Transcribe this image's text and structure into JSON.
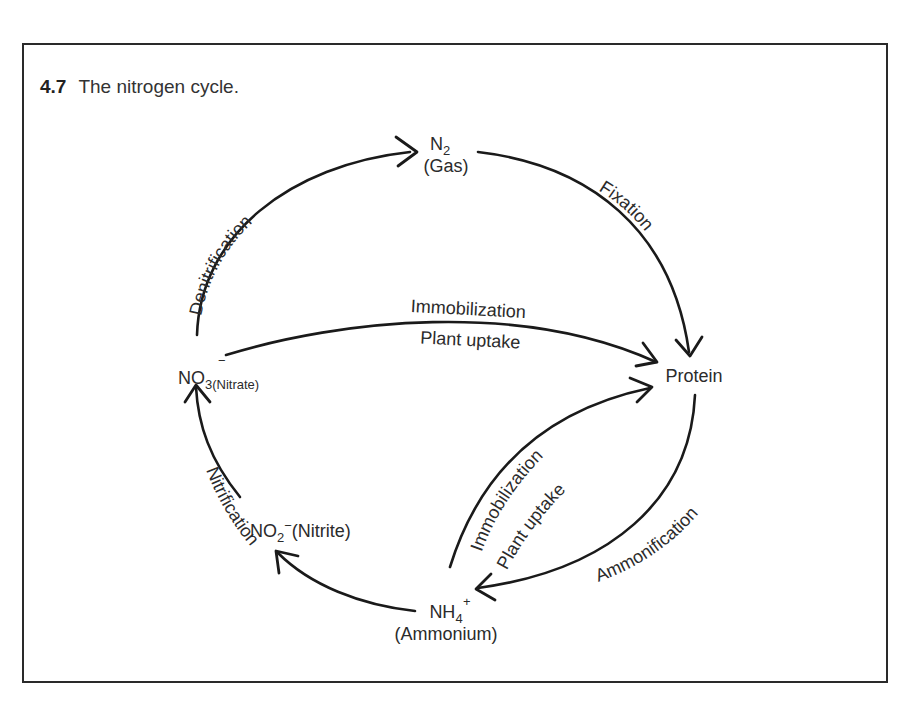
{
  "figure": {
    "number": "4.7",
    "caption": "The nitrogen cycle."
  },
  "nodes": {
    "n2": {
      "formula": "N",
      "subscript": "2",
      "name": "(Gas)"
    },
    "protein": {
      "name": "Protein"
    },
    "ammonium": {
      "formula": "NH",
      "subscript": "4",
      "superscript": "+",
      "name": "(Ammonium)"
    },
    "nitrite": {
      "formula": "NO",
      "subscript": "2",
      "superscript": "−",
      "name": "(Nitrite)"
    },
    "nitrate": {
      "formula": "NO",
      "subscript": "3",
      "superscript": "−",
      "name": "(Nitrate)"
    }
  },
  "processes": {
    "denitrification": "Denitrification",
    "fixation": "Fixation",
    "ammonification": "Ammonification",
    "nitrification": "Nitrification",
    "nitrate_to_protein_top": "Immobilization",
    "nitrate_to_protein_bottom": "Plant uptake",
    "ammonium_to_protein_top": "Immobilization",
    "ammonium_to_protein_bottom": "Plant uptake"
  },
  "edges": [
    {
      "from": "nitrate",
      "to": "n2",
      "label": "Denitrification"
    },
    {
      "from": "n2",
      "to": "protein",
      "label": "Fixation"
    },
    {
      "from": "protein",
      "to": "ammonium",
      "label": "Ammonification"
    },
    {
      "from": "ammonium",
      "to": "nitrite",
      "label": "Nitrification"
    },
    {
      "from": "nitrite",
      "to": "nitrate",
      "label": "Nitrification"
    },
    {
      "from": "nitrate",
      "to": "protein",
      "label": "Immobilization / Plant uptake"
    },
    {
      "from": "ammonium",
      "to": "protein",
      "label": "Immobilization / Plant uptake"
    }
  ],
  "colors": {
    "ink": "#1a1a1a",
    "text": "#2b2b2b",
    "border": "#2a2a2a",
    "background": "#ffffff"
  }
}
